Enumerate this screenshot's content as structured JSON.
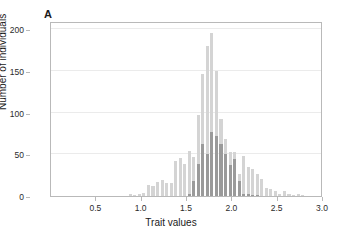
{
  "figure": {
    "panel_label": "A",
    "background_color": "#ffffff",
    "frame_color": "#b9b9b9",
    "grid_color": "#ebebeb"
  },
  "chart_data": {
    "type": "bar",
    "subtype": "overlaid-histogram",
    "title": "",
    "xlabel": "Trait values",
    "ylabel": "Number of individuals",
    "xlim": [
      0,
      3.0
    ],
    "ylim": [
      0,
      210
    ],
    "xticks": [
      0.5,
      1.0,
      1.5,
      2.0,
      2.5,
      3.0
    ],
    "xtick_labels": [
      "0.5",
      "1.0",
      "1.5",
      "2.0",
      "2.5",
      "3.0"
    ],
    "yticks": [
      0,
      50,
      100,
      150,
      200
    ],
    "ytick_labels": [
      "0",
      "50",
      "100",
      "150",
      "200"
    ],
    "grid": "horizontal",
    "legend": "none",
    "bin_width": 0.05,
    "bin_centers": [
      0.875,
      0.925,
      0.975,
      1.025,
      1.075,
      1.125,
      1.175,
      1.225,
      1.275,
      1.325,
      1.375,
      1.425,
      1.475,
      1.525,
      1.575,
      1.625,
      1.675,
      1.725,
      1.775,
      1.825,
      1.875,
      1.925,
      1.975,
      2.025,
      2.075,
      2.125,
      2.175,
      2.225,
      2.275,
      2.325,
      2.375,
      2.425,
      2.475,
      2.525,
      2.575,
      2.625,
      2.675,
      2.725,
      2.775
    ],
    "series": [
      {
        "name": "light-distribution",
        "color": "#d4d4d4",
        "values": [
          2,
          1,
          2,
          4,
          13,
          12,
          17,
          19,
          16,
          16,
          42,
          46,
          38,
          54,
          47,
          97,
          147,
          180,
          196,
          150,
          92,
          68,
          53,
          53,
          27,
          48,
          35,
          33,
          26,
          20,
          10,
          9,
          6,
          3,
          6,
          2,
          1,
          2,
          1
        ]
      },
      {
        "name": "dark-distribution",
        "color": "#9a9a9a",
        "values": [
          0,
          0,
          0,
          0,
          0,
          0,
          0,
          0,
          0,
          0,
          0,
          0,
          0,
          3,
          18,
          39,
          63,
          50,
          77,
          72,
          63,
          50,
          37,
          44,
          18,
          3,
          2,
          1,
          1,
          0,
          0,
          0,
          0,
          0,
          0,
          0,
          0,
          0,
          0
        ]
      }
    ]
  }
}
